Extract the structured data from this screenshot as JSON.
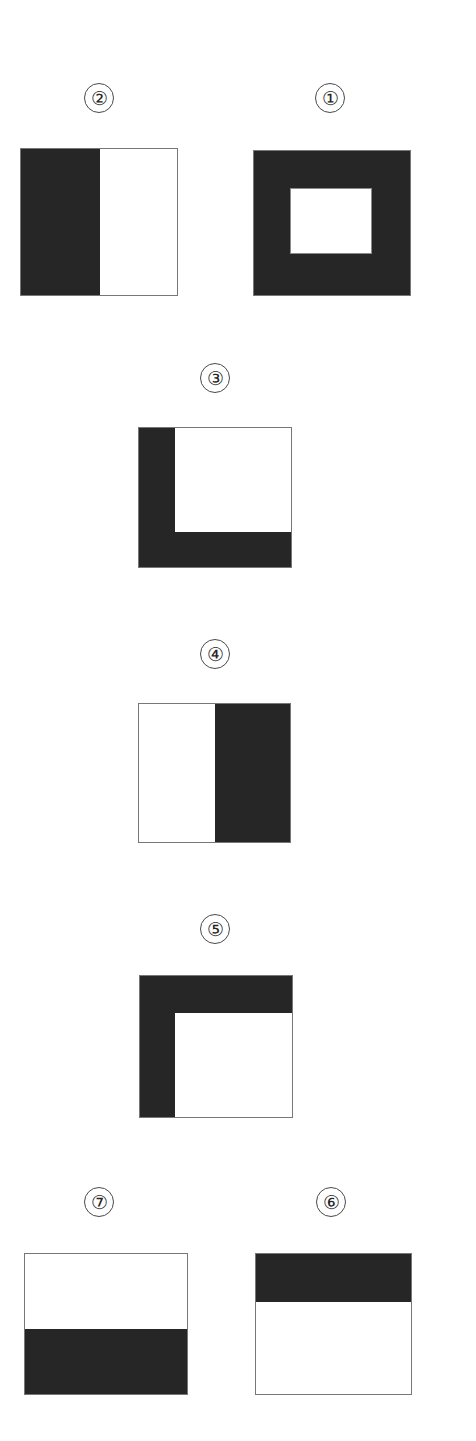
{
  "figure": {
    "background_color": "#ffffff",
    "ink_color": "#262626",
    "outline_color": "#777777",
    "panels": [
      {
        "id": "panel-2",
        "label": "②",
        "number": "2",
        "pattern": "left-half-black",
        "label_x": 84,
        "label_y": 83,
        "tile_x": 20,
        "tile_y": 148,
        "tile_w": 158,
        "tile_h": 148,
        "bands": [
          {
            "name": "left-half",
            "left": 0,
            "top": 0,
            "width": 79,
            "height": 148
          }
        ],
        "hole": null
      },
      {
        "id": "panel-1",
        "label": "①",
        "number": "1",
        "pattern": "black-frame-with-white-center",
        "label_x": 315,
        "label_y": 83,
        "tile_x": 253,
        "tile_y": 150,
        "tile_w": 158,
        "tile_h": 146,
        "bands": [
          {
            "name": "full-fill",
            "left": 0,
            "top": 0,
            "width": 158,
            "height": 146
          }
        ],
        "hole": {
          "left": 36,
          "top": 37,
          "width": 82,
          "height": 66
        }
      },
      {
        "id": "panel-3",
        "label": "③",
        "number": "3",
        "pattern": "left-and-bottom-black",
        "label_x": 200,
        "label_y": 363,
        "tile_x": 138,
        "tile_y": 427,
        "tile_w": 154,
        "tile_h": 141,
        "bands": [
          {
            "name": "left-band",
            "left": 0,
            "top": 0,
            "width": 36,
            "height": 141
          },
          {
            "name": "bottom-band",
            "left": 0,
            "top": 104,
            "width": 154,
            "height": 37
          }
        ],
        "hole": null
      },
      {
        "id": "panel-4",
        "label": "④",
        "number": "4",
        "pattern": "right-half-black",
        "label_x": 200,
        "label_y": 639,
        "tile_x": 138,
        "tile_y": 703,
        "tile_w": 153,
        "tile_h": 140,
        "bands": [
          {
            "name": "right-half",
            "left": 76,
            "top": 0,
            "width": 77,
            "height": 140
          }
        ],
        "hole": null
      },
      {
        "id": "panel-5",
        "label": "⑤",
        "number": "5",
        "pattern": "top-and-left-black",
        "label_x": 200,
        "label_y": 914,
        "tile_x": 139,
        "tile_y": 975,
        "tile_w": 154,
        "tile_h": 143,
        "bands": [
          {
            "name": "top-band",
            "left": 0,
            "top": 0,
            "width": 154,
            "height": 37
          },
          {
            "name": "left-band",
            "left": 0,
            "top": 0,
            "width": 35,
            "height": 143
          }
        ],
        "hole": null
      },
      {
        "id": "panel-7",
        "label": "⑦",
        "number": "7",
        "pattern": "bottom-band-black",
        "label_x": 84,
        "label_y": 1187,
        "tile_x": 24,
        "tile_y": 1253,
        "tile_w": 164,
        "tile_h": 142,
        "bands": [
          {
            "name": "bottom-band",
            "left": 0,
            "top": 75,
            "width": 164,
            "height": 67
          }
        ],
        "hole": null
      },
      {
        "id": "panel-6",
        "label": "⑥",
        "number": "6",
        "pattern": "top-band-black",
        "label_x": 316,
        "label_y": 1187,
        "tile_x": 255,
        "tile_y": 1253,
        "tile_w": 157,
        "tile_h": 142,
        "bands": [
          {
            "name": "top-band",
            "left": 0,
            "top": 0,
            "width": 157,
            "height": 48
          }
        ],
        "hole": null
      }
    ]
  }
}
